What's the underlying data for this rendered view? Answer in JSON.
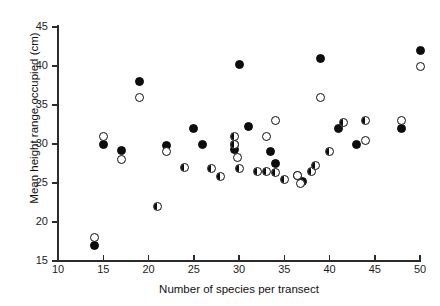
{
  "chart_data": {
    "type": "scatter",
    "title": "",
    "xlabel": "Number of species per transect",
    "ylabel": "Mean height range occupied (cm)",
    "xlim": [
      10,
      50
    ],
    "ylim": [
      15,
      45
    ],
    "xticks": [
      10,
      15,
      20,
      25,
      30,
      35,
      40,
      45,
      50
    ],
    "yticks": [
      15,
      20,
      25,
      30,
      35,
      40,
      45
    ],
    "grid": false,
    "legend": "none",
    "marker_styles": [
      "filled",
      "open",
      "half"
    ],
    "series": [
      {
        "name": "filled",
        "marker": "filled",
        "points": [
          [
            14,
            17
          ],
          [
            15,
            30
          ],
          [
            17,
            29.2
          ],
          [
            19,
            38
          ],
          [
            22,
            29.8
          ],
          [
            25,
            32
          ],
          [
            26,
            30
          ],
          [
            29.5,
            29.3
          ],
          [
            30,
            40.2
          ],
          [
            31,
            32.2
          ],
          [
            33.5,
            29
          ],
          [
            34,
            27.5
          ],
          [
            36.5,
            26
          ],
          [
            37,
            25.2
          ],
          [
            39,
            41
          ],
          [
            41,
            32
          ],
          [
            43,
            30
          ],
          [
            48,
            32
          ],
          [
            50,
            42
          ]
        ]
      },
      {
        "name": "open",
        "marker": "open",
        "points": [
          [
            14,
            18
          ],
          [
            15,
            31
          ],
          [
            17,
            28
          ],
          [
            19,
            36
          ],
          [
            22,
            29
          ],
          [
            29.5,
            30
          ],
          [
            29.8,
            28.3
          ],
          [
            33,
            31
          ],
          [
            34,
            33
          ],
          [
            36.5,
            26
          ],
          [
            36.8,
            25
          ],
          [
            39,
            36
          ],
          [
            44,
            30.5
          ],
          [
            48,
            33
          ],
          [
            50,
            40
          ]
        ]
      },
      {
        "name": "half",
        "marker": "half",
        "points": [
          [
            21,
            22
          ],
          [
            24,
            27
          ],
          [
            27,
            26.8
          ],
          [
            28,
            25.8
          ],
          [
            29.5,
            31
          ],
          [
            29.5,
            30
          ],
          [
            30,
            26.8
          ],
          [
            32,
            26.5
          ],
          [
            33,
            26.5
          ],
          [
            34,
            26.3
          ],
          [
            35,
            25.5
          ],
          [
            38,
            26.5
          ],
          [
            38.5,
            27.3
          ],
          [
            40,
            29
          ],
          [
            41.5,
            32.8
          ],
          [
            44,
            33
          ]
        ]
      }
    ]
  },
  "axes": {
    "x_tick_labels": [
      "10",
      "15",
      "20",
      "25",
      "30",
      "35",
      "40",
      "45",
      "50"
    ],
    "y_tick_labels": [
      "15",
      "20",
      "25",
      "30",
      "35",
      "40",
      "45"
    ],
    "x_title": "Number of species per transect",
    "y_title": "Mean height range occupied (cm)"
  }
}
